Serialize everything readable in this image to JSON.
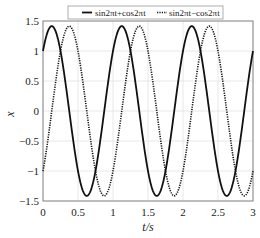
{
  "chart_data": {
    "type": "line",
    "title": "",
    "xlabel": "t/s",
    "ylabel": "x",
    "xlim": [
      0,
      3
    ],
    "ylim": [
      -1.5,
      1.5
    ],
    "xticks": [
      "0",
      "0.5",
      "1",
      "1.5",
      "2",
      "2.5",
      "3"
    ],
    "yticks": [
      "1.5",
      "1",
      "0.5",
      "0",
      "−0.5",
      "−1",
      "−1.5"
    ],
    "grid": true,
    "legend_position": "top",
    "series": [
      {
        "name": "sin2πt+cos2πt",
        "style": "solid",
        "formula": "sin(2πt)+cos(2πt)",
        "amplitude": 1.414,
        "t0_value": 1,
        "t_end_value": 1
      },
      {
        "name": "sin2πt−cos2πt",
        "style": "dotted",
        "formula": "sin(2πt)-cos(2πt)",
        "amplitude": 1.414,
        "t0_value": -1,
        "t_end_value": -1
      }
    ]
  },
  "legend": {
    "item1": "sin2πt+cos2πt",
    "item2": "sin2πt−cos2πt"
  },
  "axes": {
    "xlabel": "t/s",
    "ylabel": "x",
    "xticks": [
      "0",
      "0.5",
      "1",
      "1.5",
      "2",
      "2.5",
      "3"
    ],
    "yticks": [
      "1.5",
      "1",
      "0.5",
      "0",
      "−0.5",
      "−1",
      "−1.5"
    ]
  }
}
